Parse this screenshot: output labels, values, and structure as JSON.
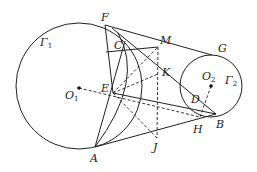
{
  "figure": {
    "circles": [
      {
        "name": "Γ1",
        "center_label": "O",
        "center_sub": "1",
        "cx": 79,
        "cy": 86,
        "r": 63,
        "label": "Γ",
        "label_sub": "1",
        "lx": 40,
        "ly": 44
      },
      {
        "name": "Γ2",
        "center_label": "O",
        "center_sub": "2",
        "cx": 211,
        "cy": 86,
        "r": 31,
        "label": "Γ",
        "label_sub": "2",
        "lx": 226,
        "ly": 82
      }
    ],
    "points": {
      "F": {
        "label": "F",
        "x": 105,
        "y": 25,
        "lx": 101,
        "ly": 20
      },
      "C": {
        "label": "C",
        "x": 125,
        "y": 41,
        "lx": 114,
        "ly": 48
      },
      "M": {
        "label": "M",
        "x": 158,
        "y": 47,
        "lx": 160,
        "ly": 43
      },
      "G": {
        "label": "G",
        "x": 212,
        "y": 55,
        "lx": 218,
        "ly": 52
      },
      "E": {
        "label": "E",
        "x": 113,
        "y": 93,
        "lx": 101,
        "ly": 91
      },
      "K": {
        "label": "K",
        "x": 158,
        "y": 74,
        "lx": 162,
        "ly": 75
      },
      "D": {
        "label": "D",
        "x": 194,
        "y": 106,
        "lx": 192,
        "ly": 102
      },
      "H": {
        "label": "H",
        "x": 200,
        "y": 117,
        "lx": 193,
        "ly": 133
      },
      "B": {
        "label": "B",
        "x": 216,
        "y": 114,
        "lx": 215,
        "ly": 128
      },
      "J": {
        "label": "J",
        "x": 157,
        "y": 138,
        "lx": 153,
        "ly": 150
      },
      "A": {
        "label": "A",
        "x": 95,
        "y": 147,
        "lx": 90,
        "ly": 162
      },
      "O1": {
        "label": "O",
        "sub": "1",
        "x": 79,
        "y": 88,
        "lx": 66,
        "ly": 98
      },
      "O2": {
        "label": "O",
        "sub": "2",
        "x": 211,
        "y": 86,
        "lx": 203,
        "ly": 79
      }
    }
  }
}
